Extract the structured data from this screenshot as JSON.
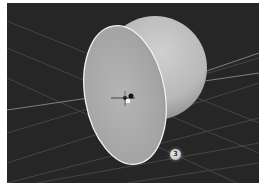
{
  "viewport": {
    "background": "#262626",
    "grid_color": "#5a5a5a",
    "object": {
      "type": "sphere-cut-by-plane",
      "sphere_color": "#bdbdbd",
      "cut_face_color": "#a9a9a9",
      "cut_outline_color": "#f2f2f2"
    },
    "gizmo": "transform-gizmo",
    "callout": {
      "label": "3"
    }
  }
}
